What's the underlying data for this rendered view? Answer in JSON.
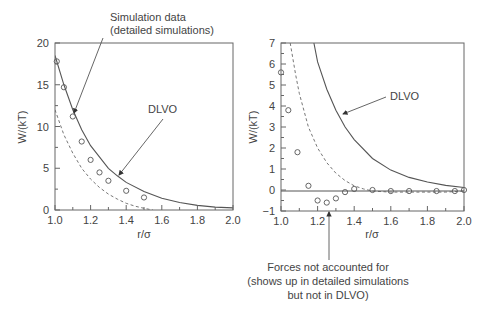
{
  "chart_data": [
    {
      "type": "line",
      "panel": "left",
      "xlabel": "r/σ",
      "ylabel": "W/(kT)",
      "xlim": [
        1.0,
        2.0
      ],
      "ylim": [
        0,
        20
      ],
      "xticks": [
        "1.0",
        "1.2",
        "1.4",
        "1.6",
        "1.8",
        "2.0"
      ],
      "yticks": [
        "0",
        "5",
        "10",
        "15",
        "20"
      ],
      "grid": false,
      "series": [
        {
          "name": "Simulation data (detailed simulations)",
          "style": "open circles",
          "x": [
            1.01,
            1.05,
            1.1,
            1.15,
            1.2,
            1.25,
            1.3,
            1.4,
            1.5
          ],
          "y": [
            17.8,
            14.7,
            11.2,
            8.2,
            6.0,
            4.5,
            3.5,
            2.3,
            1.5
          ]
        },
        {
          "name": "DLVO",
          "style": "solid line",
          "x": [
            1.0,
            1.05,
            1.1,
            1.15,
            1.2,
            1.3,
            1.35,
            1.4,
            1.5,
            1.6,
            1.7,
            1.8,
            1.9,
            2.0
          ],
          "y": [
            18.5,
            15.0,
            12.0,
            9.6,
            7.7,
            5.0,
            4.1,
            3.3,
            2.2,
            1.4,
            0.9,
            0.55,
            0.35,
            0.25
          ]
        },
        {
          "name": "dashed curve",
          "style": "dashed line",
          "x": [
            1.0,
            1.05,
            1.1,
            1.15,
            1.2,
            1.25,
            1.3,
            1.35,
            1.4,
            1.45,
            1.5,
            1.55
          ],
          "y": [
            12.0,
            9.0,
            6.8,
            5.0,
            3.7,
            2.7,
            1.9,
            1.3,
            0.8,
            0.45,
            0.2,
            0.0
          ]
        }
      ],
      "annotations": [
        {
          "text": "Simulation data",
          "text2": "(detailed simulations)",
          "points_to": [
            1.11,
            11.8
          ]
        },
        {
          "text": "DLVO",
          "points_to": [
            1.35,
            4.2
          ]
        }
      ]
    },
    {
      "type": "line",
      "panel": "right",
      "xlabel": "r/σ",
      "ylabel": "W/(kT)",
      "xlim": [
        1.0,
        2.0
      ],
      "ylim": [
        -1,
        7
      ],
      "xticks": [
        "1.0",
        "1.2",
        "1.4",
        "1.6",
        "1.8",
        "2.0"
      ],
      "yticks": [
        "−1",
        "0",
        "1",
        "2",
        "3",
        "4",
        "5",
        "6",
        "7"
      ],
      "grid": false,
      "series": [
        {
          "name": "Simulation data",
          "style": "open circles",
          "x": [
            1.0,
            1.04,
            1.09,
            1.15,
            1.2,
            1.25,
            1.3,
            1.35,
            1.4,
            1.5,
            1.6,
            1.7,
            1.85,
            1.95,
            2.0
          ],
          "y": [
            5.6,
            3.8,
            1.8,
            0.2,
            -0.5,
            -0.6,
            -0.4,
            -0.1,
            0.05,
            0.0,
            -0.05,
            -0.05,
            -0.05,
            -0.05,
            0.0
          ]
        },
        {
          "name": "DLVO",
          "style": "solid line",
          "x": [
            1.18,
            1.2,
            1.25,
            1.3,
            1.35,
            1.4,
            1.5,
            1.6,
            1.7,
            1.8,
            1.9,
            2.0
          ],
          "y": [
            7.0,
            6.1,
            4.8,
            3.8,
            3.0,
            2.4,
            1.5,
            0.95,
            0.6,
            0.38,
            0.22,
            0.12
          ]
        },
        {
          "name": "dashed curve",
          "style": "dashed line",
          "x": [
            1.05,
            1.08,
            1.1,
            1.15,
            1.2,
            1.25,
            1.3,
            1.35,
            1.4,
            1.45,
            1.5,
            1.6,
            1.7,
            1.8,
            1.9,
            2.0
          ],
          "y": [
            7.0,
            5.5,
            4.6,
            3.0,
            2.0,
            1.3,
            0.8,
            0.45,
            0.2,
            0.05,
            -0.05,
            -0.1,
            -0.1,
            -0.1,
            -0.1,
            -0.05
          ]
        }
      ],
      "annotations": [
        {
          "text": "DLVO",
          "points_to": [
            1.34,
            3.6
          ]
        },
        {
          "text": "Forces not accounted for",
          "text2": "(shows up in detailed simulations",
          "text3": "but not in DLVO)",
          "points_to": [
            1.26,
            -0.9
          ]
        }
      ]
    }
  ],
  "labels": {
    "left": {
      "ylabel": "W/(kT)",
      "xlabel": "r/σ",
      "sim_label_1": "Simulation data",
      "sim_label_2": "(detailed simulations)",
      "dlvo_label": "DLVO",
      "yticks": [
        "20",
        "15",
        "10",
        "5",
        "0"
      ],
      "xticks": [
        "1.0",
        "1.2",
        "1.4",
        "1.6",
        "1.8",
        "2.0"
      ]
    },
    "right": {
      "ylabel": "W/(kT)",
      "xlabel": "r/σ",
      "dlvo_label": "DLVO",
      "forces_label_1": "Forces not accounted for",
      "forces_label_2": "(shows up in detailed simulations",
      "forces_label_3": "but not in DLVO)",
      "yticks": [
        "7",
        "6",
        "5",
        "4",
        "3",
        "2",
        "1",
        "0",
        "−1"
      ],
      "xticks": [
        "1.0",
        "1.2",
        "1.4",
        "1.6",
        "1.8",
        "2.0"
      ]
    }
  }
}
